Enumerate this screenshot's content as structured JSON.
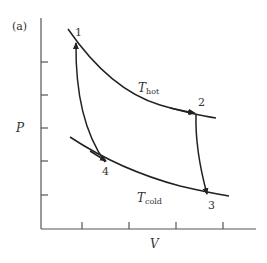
{
  "panel_label": "(a)",
  "axes": {
    "ylabel": "P",
    "xlabel": "V"
  },
  "isotherms": {
    "hot": {
      "symbol": "T",
      "subscript": "hot"
    },
    "cold": {
      "symbol": "T",
      "subscript": "cold"
    }
  },
  "points": {
    "p1": "1",
    "p2": "2",
    "p3": "3",
    "p4": "4"
  },
  "colors": {
    "line": "#222222",
    "axis": "#555555"
  }
}
